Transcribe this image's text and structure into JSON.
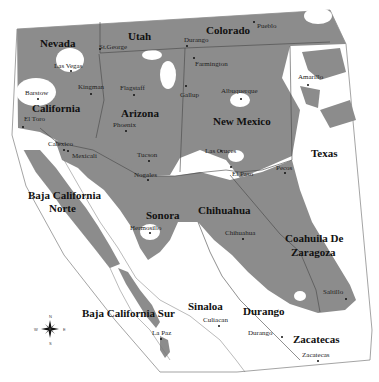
{
  "map": {
    "region": "Southwestern United States and Northern Mexico",
    "colors": {
      "shaded": "#8c8c8c",
      "background": "#ffffff",
      "border": "#555555",
      "text": "#111111"
    },
    "states": [
      {
        "name": "Nevada",
        "x": 40,
        "y": 38
      },
      {
        "name": "Utah",
        "x": 128,
        "y": 31
      },
      {
        "name": "Colorado",
        "x": 206,
        "y": 25
      },
      {
        "name": "California",
        "x": 32,
        "y": 103
      },
      {
        "name": "Arizona",
        "x": 121,
        "y": 108
      },
      {
        "name": "New Mexico",
        "x": 213,
        "y": 116
      },
      {
        "name": "Texas",
        "x": 311,
        "y": 148
      },
      {
        "name": "Baja California",
        "x": 28,
        "y": 190
      },
      {
        "name": "Norte",
        "x": 49,
        "y": 203
      },
      {
        "name": "Sonora",
        "x": 146,
        "y": 210
      },
      {
        "name": "Chihuahua",
        "x": 198,
        "y": 205
      },
      {
        "name": "Coahuila De",
        "x": 285,
        "y": 233
      },
      {
        "name": "Zaragoza",
        "x": 291,
        "y": 247
      },
      {
        "name": "Baja California Sur",
        "x": 82,
        "y": 308
      },
      {
        "name": "Sinaloa",
        "x": 188,
        "y": 301
      },
      {
        "name": "Durango",
        "x": 243,
        "y": 306
      },
      {
        "name": "Zacatecas",
        "x": 293,
        "y": 334
      }
    ],
    "cities": [
      {
        "name": "St.George",
        "x": 99,
        "y": 44,
        "dx": 99,
        "dy": 48
      },
      {
        "name": "Durango",
        "x": 184,
        "y": 37,
        "dx": 186,
        "dy": 45
      },
      {
        "name": "Pueblo",
        "x": 257,
        "y": 23,
        "dx": 253,
        "dy": 21
      },
      {
        "name": "Las Vegas",
        "x": 54,
        "y": 63,
        "dx": 70,
        "dy": 70
      },
      {
        "name": "Farmington",
        "x": 195,
        "y": 61,
        "dx": 193,
        "dy": 57
      },
      {
        "name": "Amarillo",
        "x": 298,
        "y": 74,
        "dx": 307,
        "dy": 84
      },
      {
        "name": "Barstow",
        "x": 25,
        "y": 90,
        "dx": 37,
        "dy": 98
      },
      {
        "name": "Kingman",
        "x": 78,
        "y": 84,
        "dx": 90,
        "dy": 93
      },
      {
        "name": "Flagstaff",
        "x": 120,
        "y": 85,
        "dx": 133,
        "dy": 94
      },
      {
        "name": "Gallup",
        "x": 180,
        "y": 92,
        "dx": 185,
        "dy": 85
      },
      {
        "name": "Albuquerque",
        "x": 221,
        "y": 88,
        "dx": 240,
        "dy": 98
      },
      {
        "name": "El Toro",
        "x": 24,
        "y": 116,
        "dx": 22,
        "dy": 126
      },
      {
        "name": "Phoenix",
        "x": 113,
        "y": 122,
        "dx": 125,
        "dy": 130
      },
      {
        "name": "Calexico",
        "x": 48,
        "y": 141,
        "dx": 63,
        "dy": 149
      },
      {
        "name": "Mexicali",
        "x": 72,
        "y": 153,
        "dx": 67,
        "dy": 150
      },
      {
        "name": "Tucson",
        "x": 137,
        "y": 152,
        "dx": 148,
        "dy": 160
      },
      {
        "name": "Las Cruces",
        "x": 205,
        "y": 148,
        "dx": 220,
        "dy": 150
      },
      {
        "name": "Pecos",
        "x": 276,
        "y": 165,
        "dx": 284,
        "dy": 172
      },
      {
        "name": "El Paso",
        "x": 232,
        "y": 171,
        "dx": 230,
        "dy": 166
      },
      {
        "name": "Nogales",
        "x": 134,
        "y": 172,
        "dx": 147,
        "dy": 179
      },
      {
        "name": "Chihuahua",
        "x": 225,
        "y": 230,
        "dx": 242,
        "dy": 238
      },
      {
        "name": "Hermosillo",
        "x": 130,
        "y": 225,
        "dx": 149,
        "dy": 232
      },
      {
        "name": "Saltillo",
        "x": 323,
        "y": 289,
        "dx": 345,
        "dy": 298
      },
      {
        "name": "La Paz",
        "x": 152,
        "y": 330,
        "dx": 160,
        "dy": 338
      },
      {
        "name": "Culiacan",
        "x": 203,
        "y": 317,
        "dx": 218,
        "dy": 325
      },
      {
        "name": "Durango",
        "x": 248,
        "y": 330,
        "dx": 281,
        "dy": 336
      },
      {
        "name": "Zacatecas",
        "x": 302,
        "y": 352,
        "dx": 317,
        "dy": 360
      }
    ],
    "compass": {
      "x": 50,
      "y": 329,
      "letters": {
        "n": "N",
        "s": "S",
        "e": "E",
        "w": "W"
      }
    }
  }
}
